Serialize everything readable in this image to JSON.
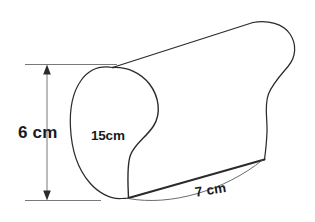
{
  "figure": {
    "type": "geometry-diagram",
    "stroke_color": "#2b2b2b",
    "text_color": "#1a1a1a",
    "background_color": "#ffffff",
    "labels": {
      "height": "6 cm",
      "depth": "15cm",
      "width": "7 cm"
    },
    "dimensions": [
      {
        "name": "height",
        "value": 6,
        "unit": "cm",
        "text": "6 cm",
        "orientation": "vertical",
        "position": "left"
      },
      {
        "name": "depth",
        "value": 15,
        "unit": "cm",
        "text": "15cm",
        "orientation": "on-face",
        "position": "front-face-center"
      },
      {
        "name": "width",
        "value": 7,
        "unit": "cm",
        "text": "7 cm",
        "orientation": "diagonal",
        "position": "bottom-edge"
      }
    ],
    "icons": {
      "arrow_up": "arrow-up-icon",
      "arrow_down": "arrow-down-icon"
    }
  }
}
